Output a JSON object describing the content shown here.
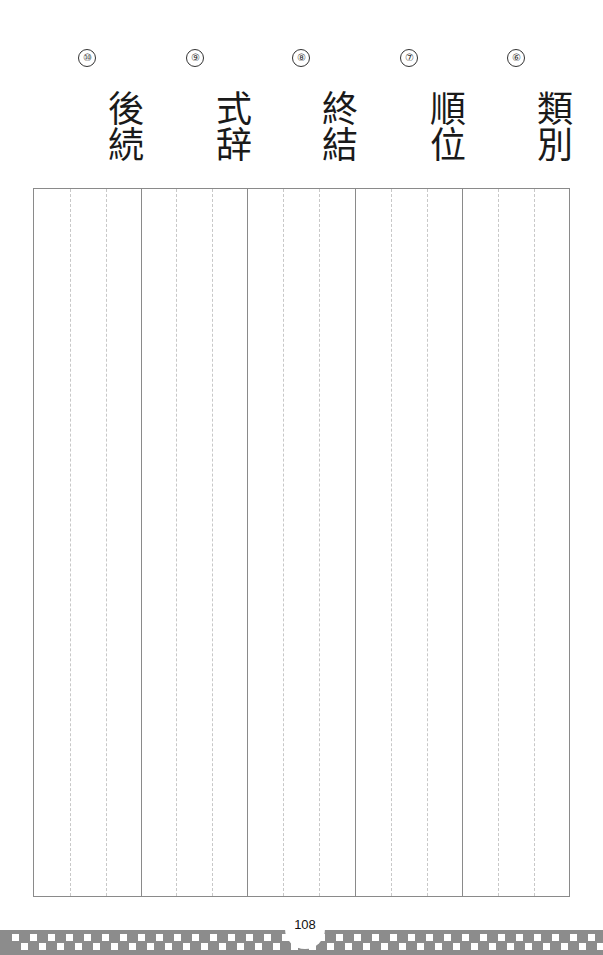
{
  "items": [
    {
      "number": "⑩",
      "word": "後続"
    },
    {
      "number": "⑨",
      "word": "式辞"
    },
    {
      "number": "⑧",
      "word": "終結"
    },
    {
      "number": "⑦",
      "word": "順位"
    },
    {
      "number": "⑥",
      "word": "類別"
    }
  ],
  "footer": {
    "page_number": "108"
  },
  "colors": {
    "band": "#8c8c8c",
    "grid_line": "#8a8a8a",
    "guide_line": "#c8c8c8"
  }
}
